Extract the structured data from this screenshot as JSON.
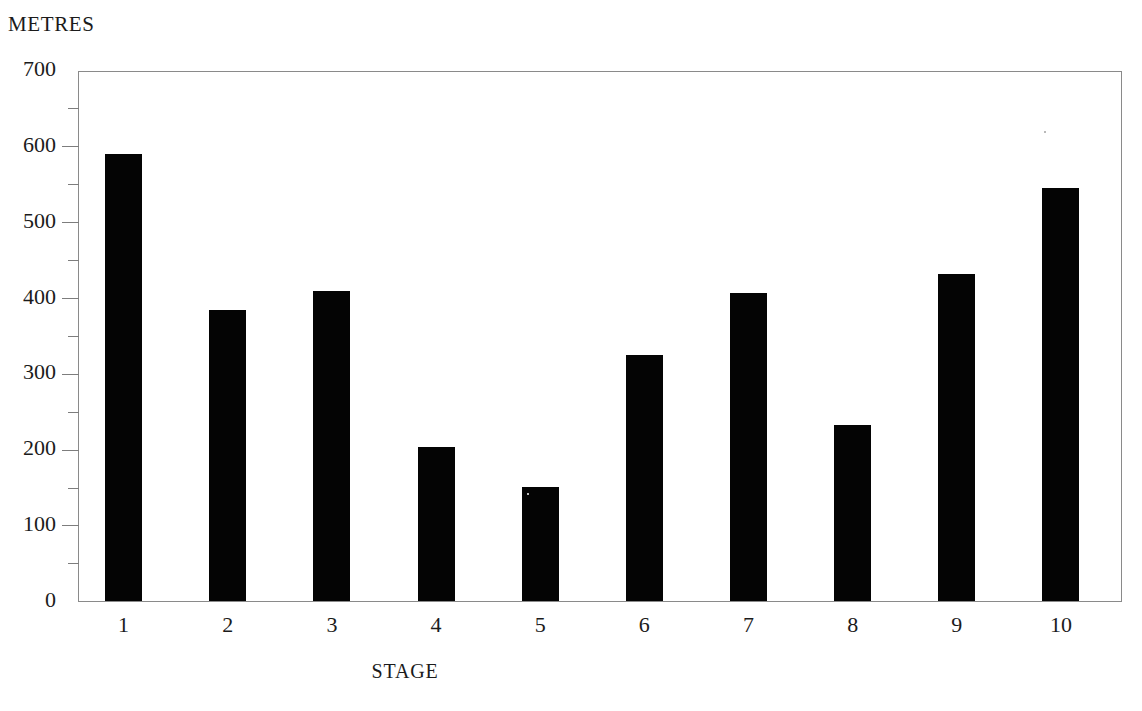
{
  "chart_data": {
    "type": "bar",
    "title": "",
    "ylabel": "METRES",
    "xlabel": "STAGE",
    "categories": [
      "1",
      "2",
      "3",
      "4",
      "5",
      "6",
      "7",
      "8",
      "9",
      "10"
    ],
    "values": [
      590,
      385,
      410,
      205,
      152,
      326,
      408,
      234,
      433,
      546
    ],
    "ylim": [
      0,
      700
    ],
    "y_ticks": [
      0,
      100,
      200,
      300,
      400,
      500,
      600,
      700
    ],
    "y_tick_labels": [
      "0",
      "100",
      "200",
      "300",
      "400",
      "500",
      "600",
      "700"
    ],
    "y_minor_ticks": [
      50,
      150,
      250,
      350,
      450,
      550,
      650
    ],
    "grid": false,
    "legend": false,
    "bar_color": "#040404",
    "axis_color": "#8a8a8a",
    "background": "#ffffff"
  },
  "axes": {
    "y_caption": "METRES",
    "x_caption": "STAGE"
  }
}
